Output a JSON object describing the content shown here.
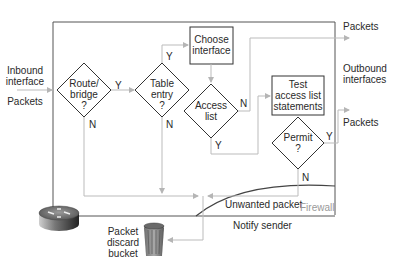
{
  "diagram": {
    "type": "flowchart"
  },
  "left": {
    "inbound_line1": "Inbound",
    "inbound_line2": "interface",
    "packets": "Packets"
  },
  "right": {
    "packets_top": "Packets",
    "outbound_line1": "Outbound",
    "outbound_line2": "interfaces",
    "packets_bottom": "Packets"
  },
  "nodes": {
    "route_bridge": {
      "line1": "Route/",
      "line2": "bridge",
      "line3": "?"
    },
    "table_entry": {
      "line1": "Table",
      "line2": "entry",
      "line3": "?"
    },
    "choose_interface": {
      "line1": "Choose",
      "line2": "interface"
    },
    "access_list": {
      "line1": "Access",
      "line2": "list"
    },
    "test_acl": {
      "line1": "Test",
      "line2": "access list",
      "line3": "statements"
    },
    "permit": {
      "line1": "Permit",
      "line2": "?"
    }
  },
  "edges": {
    "route_y": "Y",
    "route_n": "N",
    "table_y": "Y",
    "table_n": "N",
    "access_n": "N",
    "access_y": "Y",
    "permit_y": "Y",
    "permit_n": "N"
  },
  "bottom": {
    "unwanted": "Unwanted packet",
    "firewall": "Firewall",
    "notify": "Notify sender",
    "discard_line1": "Packet",
    "discard_line2": "discard",
    "discard_line3": "bucket"
  },
  "icons": {
    "router": "router-icon",
    "trash": "trash-bin-icon"
  },
  "colors": {
    "frame": "#555555",
    "flow_line": "#bbbbbb",
    "shape_stroke": "#333333",
    "firewall_text": "#999999"
  }
}
